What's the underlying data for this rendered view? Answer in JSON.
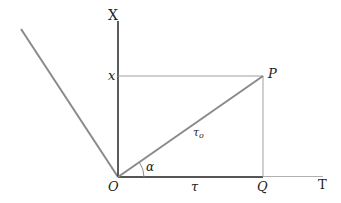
{
  "diagram": {
    "colors": {
      "axis": "#333333",
      "oblique_line": "#8a8a8a",
      "projection_lines": "#a0a0a0",
      "t_axis_ext": "#b0b0b0",
      "text": "#222222"
    },
    "points": {
      "O": {
        "x": 118,
        "y": 177
      },
      "P": {
        "x": 263,
        "y": 76
      },
      "Q": {
        "x": 263,
        "y": 177
      },
      "x_on_axis": {
        "x": 118,
        "y": 76
      },
      "oblique_start": {
        "x": 21,
        "y": 29
      }
    },
    "labels": {
      "X_axis": "X",
      "T_axis": "T",
      "x": "x",
      "P": "P",
      "O": "O",
      "Q": "Q",
      "tau": "τ",
      "tau0": "τ",
      "tau0_sub": "o",
      "alpha": "α"
    }
  }
}
